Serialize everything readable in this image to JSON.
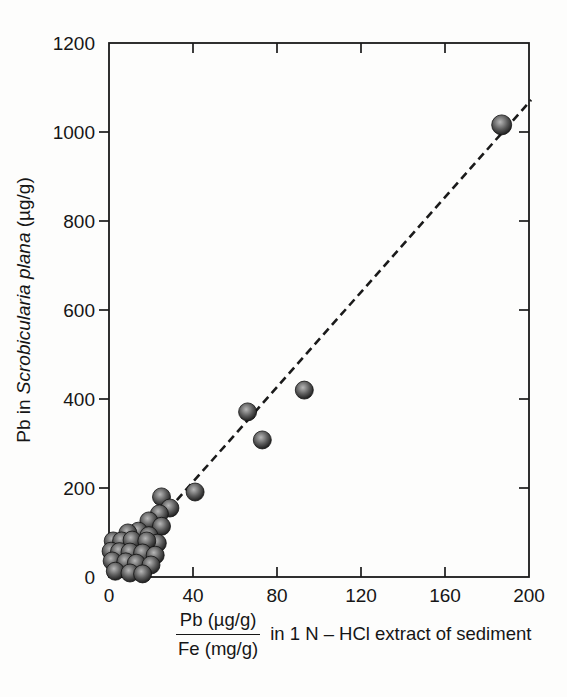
{
  "figure": {
    "background": "#fdfdfc",
    "axis_color": "#1a1a1a",
    "text_color": "#161616"
  },
  "y_axis_label": {
    "prefix": "Pb in ",
    "species_italic": "Scrobicularia plana",
    "suffix": " (µg/g)"
  },
  "x_axis_label": {
    "numerator": "Pb (µg/g)",
    "denominator": "Fe (mg/g)",
    "suffix": "in 1 N – HCl extract of sediment"
  },
  "chart_data": {
    "type": "scatter",
    "title": "",
    "xlabel": "Pb (µg/g) / Fe (mg/g) in 1 N – HCl extract of sediment",
    "ylabel": "Pb in Scrobicularia plana (µg/g)",
    "xlim": [
      0,
      200
    ],
    "ylim": [
      0,
      1200
    ],
    "x_ticks": [
      0,
      40,
      80,
      120,
      160,
      200
    ],
    "y_ticks": [
      0,
      200,
      400,
      600,
      800,
      1000,
      1200
    ],
    "grid": false,
    "legend": "none",
    "points": [
      [
        187,
        1016,
        10
      ],
      [
        93,
        420
      ],
      [
        66,
        371
      ],
      [
        73,
        308
      ],
      [
        41,
        191
      ],
      [
        25,
        180
      ],
      [
        29,
        155
      ],
      [
        24,
        142
      ],
      [
        19,
        126
      ],
      [
        25,
        114
      ],
      [
        14,
        103
      ],
      [
        9,
        99
      ],
      [
        19,
        93
      ],
      [
        23,
        76
      ],
      [
        2,
        81
      ],
      [
        6,
        81
      ],
      [
        11,
        83
      ],
      [
        18,
        81
      ],
      [
        1,
        58
      ],
      [
        5,
        57
      ],
      [
        10,
        56
      ],
      [
        16,
        54
      ],
      [
        22,
        49
      ],
      [
        1.5,
        36
      ],
      [
        8,
        34
      ],
      [
        13,
        31
      ],
      [
        20,
        27
      ],
      [
        3,
        13
      ],
      [
        10,
        9
      ],
      [
        16,
        7
      ]
    ],
    "trend_line": {
      "style": "dashed",
      "from": [
        20,
        107
      ],
      "to": [
        201,
        1072
      ],
      "color": "#1a1a1a",
      "dash": "8 5",
      "width": 2.6
    },
    "marker": {
      "shape": "shaded-sphere",
      "radius_px": 9,
      "highlight": "#b7b7b7",
      "fill_mid": "#5a5a5a",
      "fill_dark": "#161616",
      "edge": "#111111"
    }
  }
}
